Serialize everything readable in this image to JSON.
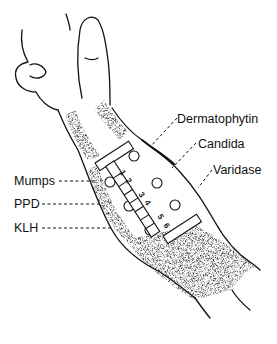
{
  "figure": {
    "labels_left": [
      {
        "text": "Mumps",
        "x": 14,
        "y": 177
      },
      {
        "text": "PPD",
        "x": 14,
        "y": 200
      },
      {
        "text": "KLH",
        "x": 14,
        "y": 224
      }
    ],
    "labels_right": [
      {
        "text": "Dermatophytin",
        "x": 177,
        "y": 115
      },
      {
        "text": "Candida",
        "x": 198,
        "y": 140
      },
      {
        "text": "Varidase",
        "x": 213,
        "y": 166
      }
    ],
    "applicator_slots": [
      "1",
      "2",
      "3",
      "4",
      "5",
      "6"
    ],
    "colors": {
      "ink": "#111111",
      "background": "#ffffff",
      "shading": "#555555"
    }
  }
}
